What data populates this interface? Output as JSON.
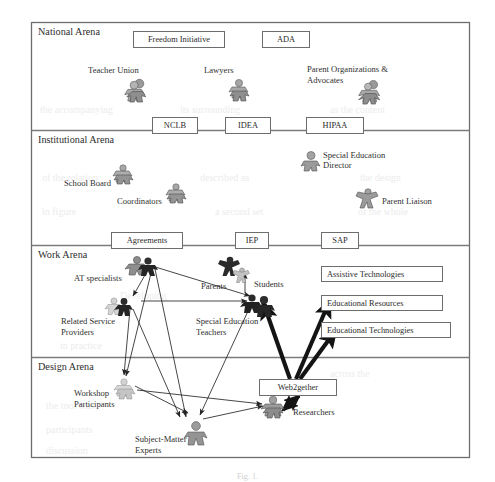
{
  "figure": {
    "caption": "Fig. 1.",
    "frame": {
      "x": 31,
      "y": 22,
      "width": 439,
      "height": 436
    }
  },
  "arenas": [
    {
      "id": "national",
      "label": "National Arena",
      "top": 22,
      "bottom": 130
    },
    {
      "id": "institutional",
      "label": "Institutional Arena",
      "top": 130,
      "bottom": 245
    },
    {
      "id": "work",
      "label": "Work Arena",
      "top": 245,
      "bottom": 357
    },
    {
      "id": "design",
      "label": "Design Arena",
      "top": 357,
      "bottom": 458
    }
  ],
  "rule_boxes": {
    "national_top": [
      {
        "id": "freedom-initiative",
        "label": "Freedom Initiative",
        "x": 133,
        "y": 31,
        "w": 92,
        "h": 17
      },
      {
        "id": "ada",
        "label": "ADA",
        "x": 262,
        "y": 31,
        "w": 48,
        "h": 17
      }
    ],
    "national_institutional_divider": [
      {
        "id": "nclb",
        "label": "NCLB",
        "x": 152,
        "y": 117,
        "w": 46,
        "h": 17
      },
      {
        "id": "idea",
        "label": "IDEA",
        "x": 225,
        "y": 117,
        "w": 46,
        "h": 17
      },
      {
        "id": "hipaa",
        "label": "HIPAA",
        "x": 306,
        "y": 117,
        "w": 58,
        "h": 17
      }
    ],
    "institutional_work_divider": [
      {
        "id": "agreements",
        "label": "Agreements",
        "x": 111,
        "y": 232,
        "w": 72,
        "h": 17
      },
      {
        "id": "iep",
        "label": "IEP",
        "x": 235,
        "y": 232,
        "w": 34,
        "h": 17
      },
      {
        "id": "sap",
        "label": "SAP",
        "x": 321,
        "y": 232,
        "w": 38,
        "h": 17
      }
    ],
    "work_resources": [
      {
        "id": "assistive-technologies",
        "label": "Assistive Technologies",
        "x": 321,
        "y": 266,
        "w": 122,
        "h": 16
      },
      {
        "id": "educational-resources",
        "label": "Educational Resources",
        "x": 321,
        "y": 295,
        "w": 122,
        "h": 16
      },
      {
        "id": "educational-technologies",
        "label": "Educational Technologies",
        "x": 321,
        "y": 322,
        "w": 130,
        "h": 16
      }
    ],
    "design_tools": [
      {
        "id": "web2gether",
        "label": "Web2gether",
        "x": 259,
        "y": 379,
        "w": 78,
        "h": 17
      }
    ]
  },
  "actors": {
    "national": [
      {
        "id": "teacher-union",
        "label": "Teacher Union",
        "label_x": 88,
        "label_y": 65,
        "icon_x": 131,
        "icon_y": 80,
        "icon": "group-figures-icon",
        "tone": "gray",
        "size": 22,
        "lines": [
          "Teacher Union"
        ]
      },
      {
        "id": "lawyers",
        "label": "Lawyers",
        "label_x": 204,
        "label_y": 65,
        "icon_x": 234,
        "icon_y": 80,
        "icon": "group-figures-icon",
        "tone": "gray",
        "size": 20,
        "lines": [
          "Lawyers"
        ]
      },
      {
        "id": "parent-organizations",
        "label": "Parent Organizations & Advocates",
        "label_x": 307,
        "label_y": 65,
        "icon_x": 364,
        "icon_y": 82,
        "icon": "group-figures-icon",
        "tone": "gray",
        "size": 22,
        "lines": [
          "Parent Organizations &",
          "Advocates"
        ]
      }
    ],
    "institutional": [
      {
        "id": "school-board",
        "label": "School Board",
        "label_x": 64,
        "label_y": 178,
        "icon_x": 118,
        "icon_y": 165,
        "icon": "group-figures-icon",
        "tone": "gray",
        "size": 18,
        "lines": [
          "School Board"
        ]
      },
      {
        "id": "coordinators",
        "label": "Coordinators",
        "label_x": 117,
        "label_y": 196,
        "icon_x": 171,
        "icon_y": 184,
        "icon": "group-figures-icon",
        "tone": "gray",
        "size": 18,
        "lines": [
          "Coordinators"
        ]
      },
      {
        "id": "special-education-director",
        "label": "Special Education Director",
        "label_x": 323,
        "label_y": 151,
        "icon_x": 303,
        "icon_y": 152,
        "icon": "single-figure-icon",
        "tone": "gray",
        "size": 18,
        "lines": [
          "Special Education",
          "Director"
        ]
      },
      {
        "id": "parent-liaison",
        "label": "Parent Liaison",
        "label_x": 385,
        "label_y": 199,
        "icon_x": 358,
        "icon_y": 189,
        "icon": "star-figure-icon",
        "tone": "gray",
        "size": 20,
        "lines": [
          "Parent Liaison"
        ]
      }
    ],
    "work": [
      {
        "id": "at-specialists",
        "label": "AT specialists",
        "label_x": 74,
        "label_y": 273,
        "icon_x": 138,
        "icon_y": 258,
        "icon": "group-figures-icon",
        "tone": "gray",
        "size": 18,
        "lines": [
          "AT specialists"
        ]
      },
      {
        "id": "parents",
        "label": "Parents",
        "label_x": 203,
        "label_y": 283,
        "icon_x": 224,
        "icon_y": 259,
        "icon": "star-figure-icon",
        "tone": "dark",
        "size": 19,
        "lines": [
          "Parents"
        ]
      },
      {
        "id": "students",
        "label": "Students",
        "label_x": 256,
        "label_y": 283,
        "icon_x": 234,
        "icon_y": 268,
        "icon": "star-figure-icon",
        "tone": "light",
        "size": 14,
        "lines": [
          "Students"
        ]
      },
      {
        "id": "related-service-providers",
        "label": "Related Service Providers",
        "label_x": 61,
        "label_y": 318,
        "icon_x": 113,
        "icon_y": 300,
        "icon": "group-figures-icon",
        "tone": "light",
        "size": 16,
        "lines": [
          "Related Service",
          "Providers"
        ]
      },
      {
        "id": "special-education-teachers",
        "label": "Special Education Teachers",
        "label_x": 196,
        "label_y": 318,
        "icon_x": 251,
        "icon_y": 299,
        "icon": "single-figure-icon",
        "tone": "dark",
        "size": 21,
        "lines": [
          "Special Education",
          "Teachers"
        ]
      }
    ],
    "design": [
      {
        "id": "workshop-participants",
        "label": "Workshop Participants",
        "label_x": 74,
        "label_y": 391,
        "icon_x": 120,
        "icon_y": 381,
        "icon": "group-figures-icon",
        "tone": "light",
        "size": 18,
        "lines": [
          "Workshop",
          "Participants"
        ]
      },
      {
        "id": "subject-matter-experts",
        "label": "Subject-Matter Experts",
        "label_x": 135,
        "label_y": 437,
        "icon_x": 193,
        "icon_y": 424,
        "icon": "single-figure-icon",
        "tone": "gray",
        "size": 21,
        "lines": [
          "Subject-Matter",
          "Experts"
        ]
      },
      {
        "id": "researchers",
        "label": "Researchers",
        "label_x": 297,
        "label_y": 410,
        "icon_x": 269,
        "icon_y": 399,
        "icon": "group-figures-icon",
        "tone": "gray",
        "size": 20,
        "lines": [
          "Researchers"
        ]
      }
    ]
  },
  "colors": {
    "frame": "#6d6d6d",
    "divider": "#7b7b7b",
    "box_border": "#6d6d6d",
    "text": "#2b2b2b",
    "arrow_thin": "#262626",
    "arrow_thick": "#1a1a1a",
    "figure_gray": "#9a9a9a",
    "figure_dark": "#2f2f2f",
    "figure_light": "#c9c9c9",
    "background": "#ffffff"
  },
  "connections": {
    "thin": [
      {
        "from": "at-specialists-hub",
        "to": "special-education-teachers"
      },
      {
        "from": "at-specialists-hub",
        "to": "related-service-providers-hub"
      },
      {
        "from": "at-specialists-hub",
        "to": "workshop-participants"
      },
      {
        "from": "at-specialists-hub",
        "to": "subject-matter-experts"
      },
      {
        "from": "related-service-providers-hub",
        "to": "special-education-teachers"
      },
      {
        "from": "related-service-providers-hub",
        "to": "workshop-participants"
      },
      {
        "from": "related-service-providers-hub",
        "to": "subject-matter-experts"
      },
      {
        "from": "special-education-teachers",
        "to": "subject-matter-experts"
      },
      {
        "from": "students",
        "to": "special-education-teachers"
      },
      {
        "from": "workshop-participants",
        "to": "subject-matter-experts"
      },
      {
        "from": "workshop-participants",
        "to": "researchers"
      },
      {
        "from": "subject-matter-experts",
        "to": "researchers"
      }
    ],
    "thick": [
      {
        "from": "web2gether",
        "to": "educational-resources"
      },
      {
        "from": "web2gether",
        "to": "educational-technologies"
      },
      {
        "from": "web2gether",
        "to": "special-education-teachers"
      },
      {
        "from": "web2gether",
        "to": "researchers"
      }
    ]
  },
  "ghost_text": [
    {
      "t": "the accompanying",
      "x": 40,
      "y": 104
    },
    {
      "t": "its surrounding",
      "x": 180,
      "y": 104
    },
    {
      "t": "as the content",
      "x": 330,
      "y": 104
    },
    {
      "t": "of the relation",
      "x": 42,
      "y": 172
    },
    {
      "t": "described as",
      "x": 200,
      "y": 172
    },
    {
      "t": "the design",
      "x": 360,
      "y": 172
    },
    {
      "t": "in figure",
      "x": 42,
      "y": 206
    },
    {
      "t": "a second set",
      "x": 215,
      "y": 206
    },
    {
      "t": "of the whole",
      "x": 358,
      "y": 206
    },
    {
      "t": "Developing",
      "x": 120,
      "y": 290
    },
    {
      "t": "in practice",
      "x": 60,
      "y": 340
    },
    {
      "t": "across the",
      "x": 330,
      "y": 368
    },
    {
      "t": "the tool was",
      "x": 46,
      "y": 400
    },
    {
      "t": "participants",
      "x": 46,
      "y": 424
    },
    {
      "t": "discussion",
      "x": 46,
      "y": 445
    }
  ]
}
